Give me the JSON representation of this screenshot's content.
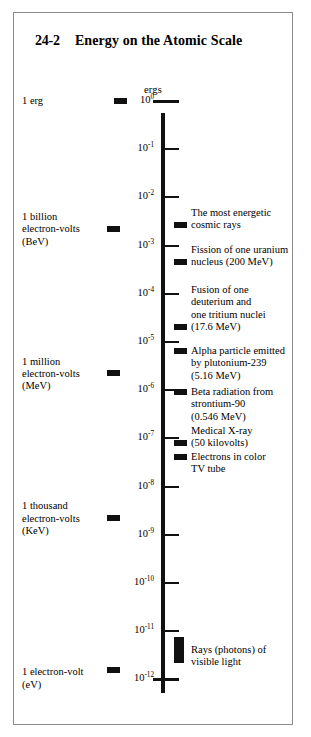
{
  "header": {
    "section_number": "24-2",
    "title": "Energy on the Atomic Scale"
  },
  "axis": {
    "units_label": "ergs",
    "ticks": [
      {
        "exponent_html": "10<sup>0</sup>",
        "plain": "10^0"
      },
      {
        "exponent_html": "10<sup>-1</sup>",
        "plain": "10^-1"
      },
      {
        "exponent_html": "10<sup>-2</sup>",
        "plain": "10^-2"
      },
      {
        "exponent_html": "10<sup>-3</sup>",
        "plain": "10^-3"
      },
      {
        "exponent_html": "10<sup>-4</sup>",
        "plain": "10^-4"
      },
      {
        "exponent_html": "10<sup>-5</sup>",
        "plain": "10^-5"
      },
      {
        "exponent_html": "10<sup>-6</sup>",
        "plain": "10^-6"
      },
      {
        "exponent_html": "10<sup>-7</sup>",
        "plain": "10^-7"
      },
      {
        "exponent_html": "10<sup>-8</sup>",
        "plain": "10^-8"
      },
      {
        "exponent_html": "10<sup>-9</sup>",
        "plain": "10^-9"
      },
      {
        "exponent_html": "10<sup>-10</sup>",
        "plain": "10^-10"
      },
      {
        "exponent_html": "10<sup>-11</sup>",
        "plain": "10^-11"
      },
      {
        "exponent_html": "10<sup>-12</sup>",
        "plain": "10^-12"
      }
    ]
  },
  "left_labels": [
    {
      "lines": [
        "1 erg"
      ]
    },
    {
      "lines": [
        "1 billion",
        "electron-volts",
        "(BeV)"
      ]
    },
    {
      "lines": [
        "1 million",
        "electron-volts",
        "(MeV)"
      ]
    },
    {
      "lines": [
        "1 thousand",
        "electron-volts",
        "(KeV)"
      ]
    },
    {
      "lines": [
        "1 electron-volt",
        "(eV)"
      ]
    }
  ],
  "right_annotations": [
    {
      "lines": [
        "The most energetic",
        "cosmic rays"
      ]
    },
    {
      "lines": [
        "Fission of one uranium",
        "nucleus (200 MeV)"
      ]
    },
    {
      "lines": [
        "Fusion of one",
        "deuterium and",
        "one tritium nuclei",
        "(17.6 MeV)"
      ]
    },
    {
      "lines": [
        "Alpha particle emitted",
        "by plutonium-239",
        "(5.16 MeV)"
      ]
    },
    {
      "lines": [
        "Beta radiation from",
        "strontium-90",
        "(0.546 MeV)"
      ]
    },
    {
      "lines": [
        "Medical X-ray",
        "(50 kilovolts)"
      ]
    },
    {
      "lines": [
        "Electrons in color",
        "TV tube"
      ]
    },
    {
      "lines": [
        "Rays (photons) of",
        "visible light"
      ]
    }
  ],
  "colors": {
    "ink": "#101010",
    "frame": "#8a8a8a",
    "page": "#ffffff"
  },
  "chart_data": {
    "type": "scatter",
    "title": "Energy on the Atomic Scale",
    "ylabel": "ergs",
    "scale": "log10",
    "ylim": [
      -12,
      0
    ],
    "grid": false,
    "legend": "none",
    "axis_tick_exponents": [
      0,
      -1,
      -2,
      -3,
      -4,
      -5,
      -6,
      -7,
      -8,
      -9,
      -10,
      -11,
      -12
    ],
    "left_scale_markers": [
      {
        "label": "1 erg",
        "exponent": 0
      },
      {
        "label": "1 billion electron-volts (BeV)",
        "exponent": -2.8
      },
      {
        "label": "1 million electron-volts (MeV)",
        "exponent": -5.8
      },
      {
        "label": "1 thousand electron-volts (KeV)",
        "exponent": -8.8
      },
      {
        "label": "1 electron-volt (eV)",
        "exponent": -11.85
      }
    ],
    "annotated_items": [
      {
        "label": "The most energetic cosmic rays",
        "exponent": -2.55
      },
      {
        "label": "Fission of one uranium nucleus (200 MeV)",
        "exponent": -3.45
      },
      {
        "label": "Fusion of one deuterium and one tritium nuclei (17.6 MeV)",
        "exponent": -4.4
      },
      {
        "label": "Alpha particle emitted by plutonium-239 (5.16 MeV)",
        "exponent": -5.05
      },
      {
        "label": "Beta radiation from strontium-90 (0.546 MeV)",
        "exponent": -6.0
      },
      {
        "label": "Medical X-ray (50 kilovolts)",
        "exponent": -7.05
      },
      {
        "label": "Electrons in color TV tube",
        "exponent": -7.45
      },
      {
        "label": "Rays (photons) of visible light",
        "exponent": -11.45,
        "marker": "range-bar"
      }
    ]
  }
}
